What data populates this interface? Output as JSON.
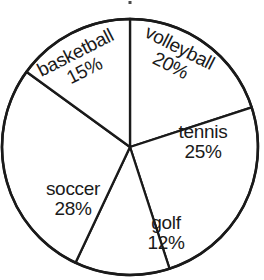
{
  "chart_data": {
    "type": "pie",
    "title": "",
    "xlabel": "",
    "ylabel": "",
    "categories": [
      "volleyball",
      "tennis",
      "golf",
      "soccer",
      "basketball"
    ],
    "values": [
      20,
      25,
      12,
      28,
      15
    ],
    "value_suffix": "%",
    "start_angle_deg": 0,
    "direction": "clockwise",
    "legend": "none",
    "grid": false,
    "slices": [
      {
        "label": "volleyball",
        "value": 20,
        "value_text": "20%",
        "start_deg": 0,
        "end_deg": 72,
        "rotation_deg": 27,
        "fill": "#ffffff",
        "stroke": "#1a1a1a"
      },
      {
        "label": "tennis",
        "value": 25,
        "value_text": "25%",
        "start_deg": 72,
        "end_deg": 162,
        "rotation_deg": 0,
        "fill": "#ffffff",
        "stroke": "#1a1a1a"
      },
      {
        "label": "golf",
        "value": 12,
        "value_text": "12%",
        "start_deg": 162,
        "end_deg": 205.2,
        "rotation_deg": 0,
        "fill": "#ffffff",
        "stroke": "#1a1a1a"
      },
      {
        "label": "soccer",
        "value": 28,
        "value_text": "28%",
        "start_deg": 205.2,
        "end_deg": 306,
        "rotation_deg": 0,
        "fill": "#ffffff",
        "stroke": "#1a1a1a"
      },
      {
        "label": "basketball",
        "value": 15,
        "value_text": "15%",
        "start_deg": 306,
        "end_deg": 360,
        "rotation_deg": -27,
        "fill": "#ffffff",
        "stroke": "#1a1a1a"
      }
    ],
    "geometry": {
      "center_x": 130,
      "center_y": 147,
      "radius": 128
    },
    "colors": {
      "background": "#ffffff",
      "stroke": "#1a1a1a",
      "text": "#1a1a1a"
    }
  }
}
